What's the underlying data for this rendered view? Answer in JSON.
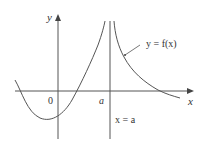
{
  "diagram": {
    "type": "function-graph",
    "axes": {
      "x_label": "x",
      "y_label": "y",
      "origin_label": "0"
    },
    "tick_labels": {
      "a": "a"
    },
    "annotations": {
      "curve_label": "y = f(x)",
      "asymptote_label": "x = a"
    },
    "colors": {
      "stroke": "#555555",
      "text": "#333333",
      "background": "#ffffff"
    }
  }
}
